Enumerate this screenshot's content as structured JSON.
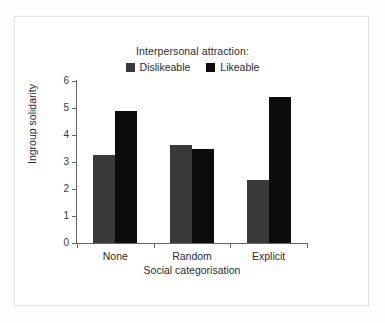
{
  "chart_data": {
    "type": "bar",
    "title": "",
    "subtitle": "",
    "xlabel": "Social categorisation",
    "ylabel": "Ingroup solidarity",
    "categories": [
      "None",
      "Random",
      "Explicit"
    ],
    "series": [
      {
        "name": "Dislikeable",
        "color": "#3a3a3a",
        "values": [
          3.25,
          3.63,
          2.35
        ]
      },
      {
        "name": "Likeable",
        "color": "#0c0c0c",
        "values": [
          4.9,
          3.48,
          5.4
        ]
      }
    ],
    "ylim": [
      0,
      6
    ],
    "ytick_labels": [
      "0",
      "1",
      "2",
      "3",
      "4",
      "5",
      "6"
    ],
    "ytick_values": [
      0,
      1,
      2,
      3,
      4,
      5,
      6
    ],
    "grid": false,
    "legend_title": "Interpersonal attraction:",
    "legend_position": "top-center",
    "annotations": []
  },
  "legend": {
    "title": "Interpersonal attraction:",
    "entries": [
      {
        "label": "Dislikeable",
        "color": "#3a3a3a"
      },
      {
        "label": "Likeable",
        "color": "#0c0c0c"
      }
    ]
  },
  "axes": {
    "y_title": "Ingroup solidarity",
    "x_title": "Social categorisation",
    "y_ticks": [
      "0",
      "1",
      "2",
      "3",
      "4",
      "5",
      "6"
    ],
    "x_categories": [
      "None",
      "Random",
      "Explicit"
    ]
  },
  "colors": {
    "background": "#ffffff",
    "frame_border": "#e4e4e4",
    "axis": "#666666",
    "text": "#2c2c2c",
    "dislikeable": "#3a3a3a",
    "likeable": "#0c0c0c"
  }
}
